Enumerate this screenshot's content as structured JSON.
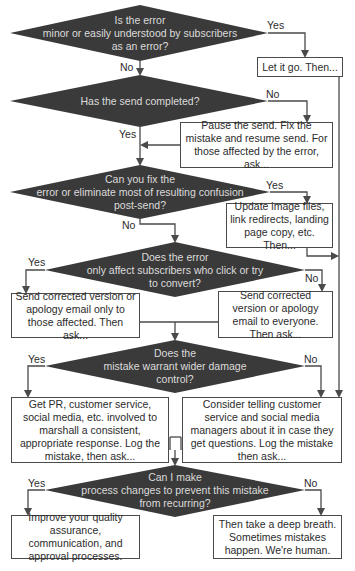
{
  "colors": {
    "decision_fill": "#3a3a3a",
    "decision_text": "#dcdcdc",
    "line": "#4a4a4a",
    "box_border": "#4a4a4a"
  },
  "decisions": [
    {
      "id": "d1",
      "lines": [
        "Is the error",
        "minor or easily understood by subscribers",
        "as an error?"
      ]
    },
    {
      "id": "d2",
      "lines": [
        "Has the send completed?"
      ]
    },
    {
      "id": "d3",
      "lines": [
        "Can you fix the",
        "error or eliminate most of resulting confusion",
        "post-send?"
      ]
    },
    {
      "id": "d4",
      "lines": [
        "Does the error",
        "only affect subscribers who click or try",
        "to convert?"
      ]
    },
    {
      "id": "d5",
      "lines": [
        "Does the",
        "mistake warrant wider damage",
        "control?"
      ]
    },
    {
      "id": "d6",
      "lines": [
        "Can I make",
        "process changes to prevent this mistake",
        "from recurring?"
      ]
    }
  ],
  "actions": {
    "let_it_go": "Let it go. Then...",
    "pause_send": "Pause the send. Fix the mistake and resume send. For those affected by the error, ask...",
    "update_files": "Update image files, link redirects, landing page copy, etc. Then...",
    "send_affected": "Send corrected version or apology email only to those affected. Then ask...",
    "send_everyone": "Send corrected version or apology email to everyone. Then ask...",
    "get_pr": "Get PR, customer service, social media, etc. involved to marshall a consistent, appropriate response. Log the mistake, then ask...",
    "consider_telling": "Consider telling customer service and social media managers about it in case they get questions. Log the mistake then ask...",
    "improve_quality": "Improve your quality assurance, communication, and approval processes.",
    "deep_breath": "Then take a deep breath. Sometimes mistakes happen. We're human."
  },
  "edge_labels": {
    "d1_yes": "Yes",
    "d1_no": "No",
    "d2_no": "No",
    "d2_yes": "Yes",
    "d3_yes": "Yes",
    "d3_no": "No",
    "d4_yes": "Yes",
    "d4_no": "No",
    "d5_yes": "Yes",
    "d5_no": "No",
    "d6_yes": "Yes",
    "d6_no": "No"
  }
}
